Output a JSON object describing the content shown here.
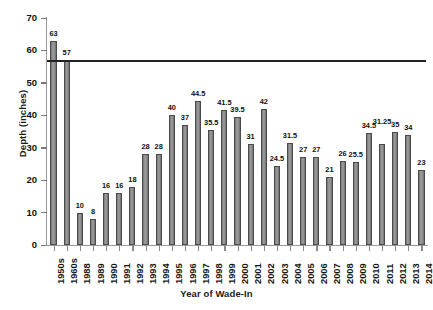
{
  "chart_data": {
    "type": "bar",
    "title": "",
    "xlabel": "Year of Wade-In",
    "ylabel": "Depth (inches)",
    "ylim": [
      0,
      70
    ],
    "yticks": [
      0,
      10,
      20,
      30,
      40,
      50,
      60,
      70
    ],
    "grid": false,
    "legend": "none",
    "bar_color": "#8c8c8c",
    "bar_edge_color": "#4a4a4a",
    "reference_line": {
      "value": 57,
      "color": "#222222",
      "orientation": "horizontal"
    },
    "categories": [
      "1950s",
      "1960s",
      "1988",
      "1989",
      "1990",
      "1991",
      "1992",
      "1993",
      "1994",
      "1995",
      "1996",
      "1997",
      "1998",
      "1999",
      "2000",
      "2001",
      "2002",
      "2003",
      "2004",
      "2005",
      "2006",
      "2007",
      "2008",
      "2009",
      "2010",
      "2011",
      "2012",
      "2013",
      "2014"
    ],
    "values": [
      63,
      57,
      10,
      8,
      16,
      16,
      18,
      28,
      28,
      40,
      37,
      44.5,
      35.5,
      41.5,
      39.5,
      31,
      42,
      24.5,
      31.5,
      27,
      27,
      21,
      26,
      25.5,
      34.5,
      31.25,
      35,
      34,
      23
    ],
    "value_labels": [
      "63",
      "57",
      "10",
      "8",
      "16",
      "16",
      "18",
      "28",
      "28",
      "40",
      "37",
      "44.5",
      "35.5",
      "41.5",
      "39.5",
      "31",
      "42",
      "24.5",
      "31.5",
      "27",
      "27",
      "21",
      "26",
      "25.5",
      "34.5",
      "31.25",
      "35",
      "34",
      "23"
    ]
  }
}
